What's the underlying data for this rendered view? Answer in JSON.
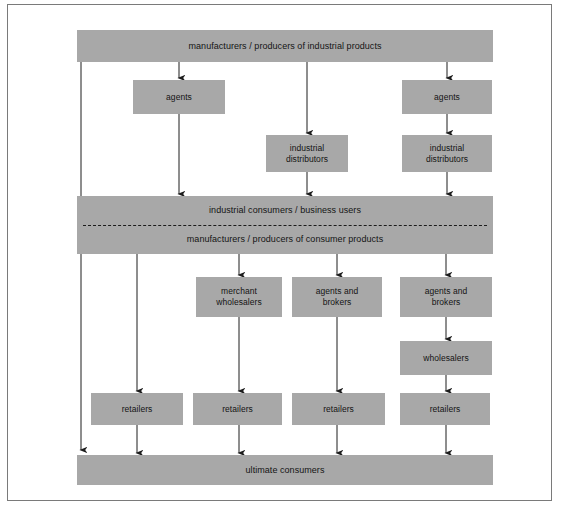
{
  "diagram": {
    "type": "flow-diagram",
    "colors": {
      "node_fill": "#a8a8a8",
      "node_text": "#141414",
      "connector": "#1c1c1c",
      "frame_border": "#7a7a7a",
      "background": "#ffffff"
    },
    "nodes": [
      {
        "id": "industrial-producers",
        "label": "manufacturers / producers of industrial products",
        "x": 77,
        "y": 30,
        "w": 416,
        "h": 32,
        "kind": "bar"
      },
      {
        "id": "agents-left",
        "label": "agents",
        "x": 133,
        "y": 80,
        "w": 92,
        "h": 34,
        "kind": "box"
      },
      {
        "id": "agents-right",
        "label": "agents",
        "x": 402,
        "y": 80,
        "w": 90,
        "h": 34,
        "kind": "box"
      },
      {
        "id": "industrial-distributors-mid",
        "label": "industrial\ndistributors",
        "x": 266,
        "y": 135,
        "w": 82,
        "h": 37,
        "kind": "box"
      },
      {
        "id": "industrial-distributors-right",
        "label": "industrial\ndistributors",
        "x": 402,
        "y": 135,
        "w": 90,
        "h": 37,
        "kind": "box"
      },
      {
        "id": "consumers-producers-band",
        "label_top": "industrial consumers / business users",
        "label_bottom": "manufacturers / producers of consumer products",
        "x": 77,
        "y": 196,
        "w": 416,
        "h": 58,
        "kind": "band"
      },
      {
        "id": "merchant-wholesalers",
        "label": "merchant\nwholesalers",
        "x": 196,
        "y": 277,
        "w": 86,
        "h": 40,
        "kind": "box"
      },
      {
        "id": "agents-and-brokers-mid",
        "label": "agents and\nbrokers",
        "x": 292,
        "y": 277,
        "w": 90,
        "h": 40,
        "kind": "box"
      },
      {
        "id": "agents-and-brokers-right",
        "label": "agents and\nbrokers",
        "x": 400,
        "y": 277,
        "w": 92,
        "h": 40,
        "kind": "box"
      },
      {
        "id": "wholesalers",
        "label": "wholesalers",
        "x": 400,
        "y": 341,
        "w": 92,
        "h": 34,
        "kind": "box"
      },
      {
        "id": "retailers-1",
        "label": "retailers",
        "x": 91,
        "y": 393,
        "w": 92,
        "h": 32,
        "kind": "box"
      },
      {
        "id": "retailers-2",
        "label": "retailers",
        "x": 193,
        "y": 393,
        "w": 89,
        "h": 32,
        "kind": "box"
      },
      {
        "id": "retailers-3",
        "label": "retailers",
        "x": 292,
        "y": 393,
        "w": 93,
        "h": 32,
        "kind": "box"
      },
      {
        "id": "retailers-4",
        "label": "retailers",
        "x": 400,
        "y": 393,
        "w": 90,
        "h": 32,
        "kind": "box"
      },
      {
        "id": "ultimate-consumers",
        "label": "ultimate consumers",
        "x": 77,
        "y": 455,
        "w": 416,
        "h": 30,
        "kind": "bar"
      }
    ],
    "connectors": [
      {
        "id": "ind-prod-to-band-direct",
        "path": "M81,62 L81,450",
        "arrow": true
      },
      {
        "id": "ind-prod-to-agents-left",
        "path": "M179,62 L179,78",
        "arrow": true
      },
      {
        "id": "ind-prod-to-dist-mid",
        "path": "M307,62 L307,133",
        "arrow": true
      },
      {
        "id": "ind-prod-to-agents-right",
        "path": "M447,62 L447,78",
        "arrow": true
      },
      {
        "id": "agents-left-to-band",
        "path": "M179,114 L179,194",
        "arrow": true
      },
      {
        "id": "agents-right-to-dist-right",
        "path": "M447,114 L447,133",
        "arrow": true
      },
      {
        "id": "dist-mid-to-band",
        "path": "M307,172 L307,194",
        "arrow": true
      },
      {
        "id": "dist-right-to-band",
        "path": "M447,172 L447,194",
        "arrow": true
      },
      {
        "id": "band-to-retailers-1",
        "path": "M137,254 L137,391",
        "arrow": true
      },
      {
        "id": "band-to-merchant-wholesalers",
        "path": "M239,254 L239,275",
        "arrow": true
      },
      {
        "id": "band-to-agents-brokers-mid",
        "path": "M337,254 L337,275",
        "arrow": true
      },
      {
        "id": "band-to-agents-brokers-right",
        "path": "M446,254 L446,275",
        "arrow": true
      },
      {
        "id": "merchant-wholesalers-to-retailers-2",
        "path": "M239,317 L239,391",
        "arrow": true
      },
      {
        "id": "agents-brokers-mid-to-retailers-3",
        "path": "M337,317 L337,391",
        "arrow": true
      },
      {
        "id": "agents-brokers-right-to-wholesalers",
        "path": "M446,317 L446,339",
        "arrow": true
      },
      {
        "id": "wholesalers-to-retailers-4",
        "path": "M446,375 L446,391",
        "arrow": true
      },
      {
        "id": "retailers-1-to-ultimate",
        "path": "M137,425 L137,453",
        "arrow": true
      },
      {
        "id": "retailers-2-to-ultimate",
        "path": "M239,425 L239,453",
        "arrow": true
      },
      {
        "id": "retailers-3-to-ultimate",
        "path": "M337,425 L337,453",
        "arrow": true
      },
      {
        "id": "retailers-4-to-ultimate",
        "path": "M446,425 L446,453",
        "arrow": true
      }
    ]
  }
}
